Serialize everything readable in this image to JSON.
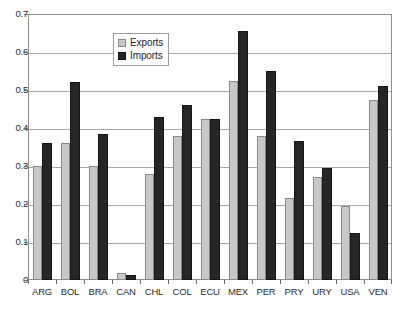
{
  "chart_data": {
    "type": "bar",
    "title": "",
    "subtitle": "",
    "xlabel": "",
    "ylabel": "",
    "ylim": [
      0,
      0.7
    ],
    "ytick_labels": [
      "0",
      "0.1",
      "0.2",
      "0.3",
      "0.4",
      "0.5",
      "0.6",
      "0.7"
    ],
    "ytick_values": [
      0,
      0.1,
      0.2,
      0.3,
      0.4,
      0.5,
      0.6,
      0.7
    ],
    "grid": "horizontal",
    "legend_position": "top-center",
    "categories": [
      "ARG",
      "BOL",
      "BRA",
      "CAN",
      "CHL",
      "COL",
      "ECU",
      "MEX",
      "PER",
      "PRY",
      "URY",
      "USA",
      "VEN"
    ],
    "series": [
      {
        "name": "Exports",
        "color": "#c8c8c8",
        "values": [
          0.3,
          0.36,
          0.3,
          0.018,
          0.28,
          0.38,
          0.425,
          0.525,
          0.38,
          0.215,
          0.27,
          0.195,
          0.475
        ]
      },
      {
        "name": "Imports",
        "color": "#262626",
        "values": [
          0.36,
          0.52,
          0.385,
          0.012,
          0.43,
          0.46,
          0.425,
          0.655,
          0.55,
          0.365,
          0.295,
          0.125,
          0.51
        ]
      }
    ]
  },
  "legend": {
    "entries": [
      {
        "label": "Exports",
        "swatch": "exports"
      },
      {
        "label": "Imports",
        "swatch": "imports"
      }
    ]
  }
}
